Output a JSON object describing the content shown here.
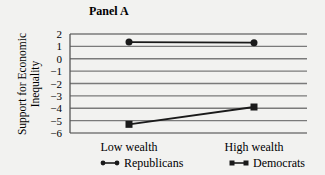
{
  "chart_data": {
    "type": "line",
    "title": "Panel A",
    "xlabel": "",
    "ylabel_lines": [
      "Support for Economic",
      "Inequality"
    ],
    "categories": [
      "Low wealth",
      "High wealth"
    ],
    "y_ticks": [
      2,
      1,
      0,
      -1,
      -2,
      -3,
      -4,
      -5,
      -6
    ],
    "y_tick_labels": [
      "2",
      "1",
      "0",
      "−1",
      "−2",
      "−3",
      "−4",
      "−5",
      "−6"
    ],
    "ylim": [
      -6,
      2
    ],
    "grid": true,
    "legend_position": "bottom",
    "series": [
      {
        "name": "Republicans",
        "marker": "circle",
        "values": [
          1.35,
          1.3
        ]
      },
      {
        "name": "Democrats",
        "marker": "square",
        "values": [
          -5.3,
          -3.9
        ]
      }
    ],
    "colors": {
      "line": "#1a1a1a",
      "grid": "#7a7a7a",
      "axis": "#555555"
    }
  }
}
